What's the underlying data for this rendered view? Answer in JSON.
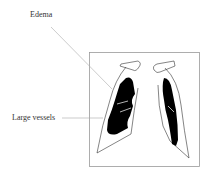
{
  "diagram": {
    "labels": {
      "edema": "Edema",
      "large_vessels": "Large vessels"
    },
    "colors": {
      "frame": "#9a9a9a",
      "leader": "#aaaaaa",
      "outline": "#333333",
      "fill": "#000000"
    }
  }
}
